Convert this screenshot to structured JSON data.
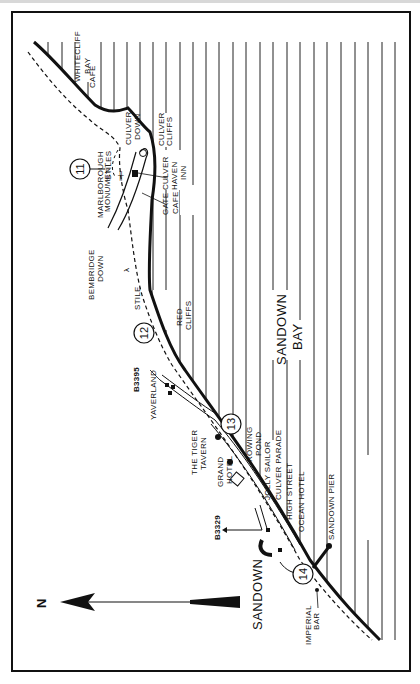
{
  "map": {
    "title": "Sandown Bay walking route",
    "orientation": "rotated 90° counter-clockwise, north points left",
    "north_arrow": {
      "label": "N"
    },
    "water_label_1": "SANDOWN",
    "water_label_2": "BAY",
    "town_label": "SANDOWN",
    "waypoints": [
      {
        "number": "11"
      },
      {
        "number": "12"
      },
      {
        "number": "13"
      },
      {
        "number": "14"
      }
    ],
    "labels": {
      "whitecliff": "WHITECLIFF",
      "bay": "BAY",
      "cafe_whitecliff": "CAFE",
      "culver_down_1": "CULVER",
      "culver_down_2": "DOWN",
      "culver_cliffs_1": "CULVER",
      "culver_cliffs_2": "CLIFFS",
      "culver_haven_1": "CULVER",
      "culver_haven_2": "HAVEN",
      "culver_haven_3": "INN",
      "gate": "GATE",
      "cafe": "CAFE",
      "stiles": "STILES",
      "marlborough_1": "MARLBOROUGH",
      "marlborough_2": "MONUMENT",
      "bembridge_1": "BEMBRIDGE",
      "bembridge_2": "DOWN",
      "stile": "STILE",
      "red": "RED",
      "cliffs": "CLIFFS",
      "road_b3395": "B3395",
      "yaverland": "YAVERLAND",
      "tiger_1": "THE TIGER",
      "tiger_2": "TAVERN",
      "rowing_1": "ROWING",
      "rowing_2": "POND",
      "grand_1": "GRAND",
      "grand_2": "HOTEL",
      "jolly_sailor": "JOLLY SAILOR",
      "culver_parade": "CULVER PARADE",
      "high_street": "HIGH STREET",
      "ocean_hotel": "OCEAN HOTEL",
      "sandown_pier": "SANDOWN PIER",
      "road_b3329": "B3329",
      "imperial_1": "IMPERIAL",
      "imperial_2": "BAR"
    },
    "colors": {
      "ink": "#111111",
      "paper": "#ffffff"
    }
  }
}
